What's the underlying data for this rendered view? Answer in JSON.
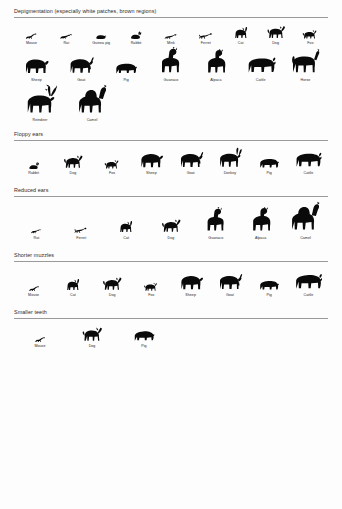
{
  "figure": {
    "ink_color": "#0a0a0a",
    "rule_color": "#9a9a9a",
    "background": "#fdfdfd"
  },
  "sections": [
    {
      "id": "depigmentation",
      "title": "Depigmentation (especially white patches, brown regions)",
      "rows": [
        [
          {
            "label": "Mouse",
            "shape": "mouse",
            "w": 20,
            "h": 12
          },
          {
            "label": "Rat",
            "shape": "rat",
            "w": 24,
            "h": 12
          },
          {
            "label": "Guinea pig",
            "shape": "guinea-pig",
            "w": 22,
            "h": 12
          },
          {
            "label": "Rabbit",
            "shape": "rabbit",
            "w": 20,
            "h": 14
          },
          {
            "label": "Mink",
            "shape": "mink",
            "w": 26,
            "h": 13
          },
          {
            "label": "Ferret",
            "shape": "ferret",
            "w": 26,
            "h": 14
          },
          {
            "label": "Cat",
            "shape": "cat",
            "w": 24,
            "h": 18
          },
          {
            "label": "Dog",
            "shape": "dog",
            "w": 26,
            "h": 19
          },
          {
            "label": "Fox",
            "shape": "fox",
            "w": 24,
            "h": 15
          }
        ],
        [
          {
            "label": "Sheep",
            "shape": "sheep",
            "w": 34,
            "h": 25
          },
          {
            "label": "Goat",
            "shape": "goat",
            "w": 34,
            "h": 26
          },
          {
            "label": "Pig",
            "shape": "pig",
            "w": 38,
            "h": 22
          },
          {
            "label": "Guanaco",
            "shape": "guanaco",
            "w": 30,
            "h": 30
          },
          {
            "label": "Alpaca",
            "shape": "alpaca",
            "w": 30,
            "h": 28
          },
          {
            "label": "Cattle",
            "shape": "cattle",
            "w": 42,
            "h": 28
          },
          {
            "label": "Horse",
            "shape": "horse",
            "w": 38,
            "h": 30
          }
        ],
        [
          {
            "label": "Reindeer",
            "shape": "reindeer",
            "w": 36,
            "h": 34
          },
          {
            "label": "Camel",
            "shape": "camel",
            "w": 40,
            "h": 34
          }
        ]
      ]
    },
    {
      "id": "floppy-ears",
      "title": "Floppy ears",
      "rows": [
        [
          {
            "label": "Rabbit",
            "shape": "rabbit",
            "w": 20,
            "h": 13
          },
          {
            "label": "Dog",
            "shape": "dog",
            "w": 28,
            "h": 20
          },
          {
            "label": "Fox",
            "shape": "fox",
            "w": 24,
            "h": 15
          },
          {
            "label": "Sheep",
            "shape": "sheep",
            "w": 36,
            "h": 24
          },
          {
            "label": "Goat",
            "shape": "goat",
            "w": 36,
            "h": 25
          },
          {
            "label": "Donkey",
            "shape": "donkey",
            "w": 36,
            "h": 26
          },
          {
            "label": "Pig",
            "shape": "pig",
            "w": 38,
            "h": 20
          },
          {
            "label": "Cattle",
            "shape": "cattle",
            "w": 40,
            "h": 26
          }
        ]
      ]
    },
    {
      "id": "reduced-ears",
      "title": "Reduced ears",
      "rows": [
        [
          {
            "label": "Rat",
            "shape": "rat",
            "w": 24,
            "h": 10
          },
          {
            "label": "Ferret",
            "shape": "ferret",
            "w": 26,
            "h": 13
          },
          {
            "label": "Cat",
            "shape": "cat",
            "w": 26,
            "h": 18
          },
          {
            "label": "Dog",
            "shape": "dog",
            "w": 30,
            "h": 20
          },
          {
            "label": "Guanaco",
            "shape": "guanaco",
            "w": 30,
            "h": 28
          },
          {
            "label": "Alpaca",
            "shape": "alpaca",
            "w": 32,
            "h": 28
          },
          {
            "label": "Camel",
            "shape": "camel",
            "w": 44,
            "h": 34
          }
        ]
      ]
    },
    {
      "id": "shorter-muzzles",
      "title": "Shorter muzzles",
      "rows": [
        [
          {
            "label": "Mouse",
            "shape": "mouse",
            "w": 20,
            "h": 11
          },
          {
            "label": "Cat",
            "shape": "cat",
            "w": 26,
            "h": 18
          },
          {
            "label": "Dog",
            "shape": "dog",
            "w": 28,
            "h": 20
          },
          {
            "label": "Fox",
            "shape": "fox",
            "w": 24,
            "h": 14
          },
          {
            "label": "Sheep",
            "shape": "sheep",
            "w": 36,
            "h": 24
          },
          {
            "label": "Goat",
            "shape": "goat",
            "w": 34,
            "h": 25
          },
          {
            "label": "Pig",
            "shape": "pig",
            "w": 38,
            "h": 20
          },
          {
            "label": "Cattle",
            "shape": "cattle",
            "w": 42,
            "h": 27
          }
        ]
      ]
    },
    {
      "id": "smaller-teeth",
      "title": "Smaller teeth",
      "rows": [
        [
          {
            "label": "Mouse",
            "shape": "mouse",
            "w": 20,
            "h": 11
          },
          {
            "label": "Dog",
            "shape": "dog",
            "w": 30,
            "h": 21
          },
          {
            "label": "Pig",
            "shape": "pig",
            "w": 40,
            "h": 21
          }
        ]
      ]
    }
  ]
}
